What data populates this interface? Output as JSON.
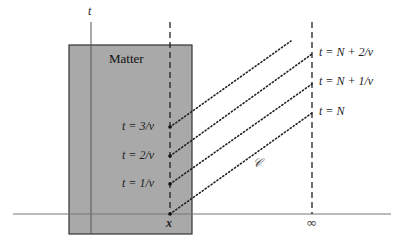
{
  "diagram": {
    "type": "spacetime-diagram",
    "axes": {
      "vertical_label": "t",
      "x_position_label": "x",
      "infinity_label": "∞"
    },
    "matter_region": {
      "label": "Matter",
      "fill": "#a9a9a9"
    },
    "worldline_points_at_x": [
      {
        "label": "t = 3/ν",
        "y": 127
      },
      {
        "label": "t = 2/ν",
        "y": 156
      },
      {
        "label": "t = 1/ν",
        "y": 184
      }
    ],
    "points_at_infinity": [
      {
        "label": "t = N + 2/ν",
        "y": 54
      },
      {
        "label": "t = N + 1/ν",
        "y": 84
      },
      {
        "label": "t = N",
        "y": 113
      }
    ],
    "curve_label": "𝒞",
    "colors": {
      "line": "#333333",
      "axis": "#555555",
      "dotted": "#222222"
    }
  }
}
